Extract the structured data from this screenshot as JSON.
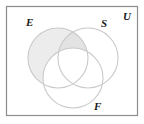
{
  "figure": {
    "kind": "venn-diagram",
    "title": "",
    "universe_border_color": "#8c8c8c",
    "circle_stroke_color": "#c9c9c9",
    "shade_light": "#ececec",
    "shade_dark": "#e3e3e3",
    "background": "#ffffff"
  },
  "universe": {
    "label": "U",
    "rect": {
      "x": 6,
      "y": 6,
      "width": 132,
      "height": 110
    }
  },
  "sets": [
    {
      "key": "E",
      "label": "E",
      "circle": {
        "cx": 58,
        "cy": 58,
        "r": 30
      },
      "label_pos": {
        "x": 26,
        "y": 17
      },
      "shaded": true
    },
    {
      "key": "S",
      "label": "S",
      "circle": {
        "cx": 88,
        "cy": 58,
        "r": 30
      },
      "label_pos": {
        "x": 101,
        "y": 18
      },
      "shaded": false
    },
    {
      "key": "F",
      "label": "F",
      "circle": {
        "cx": 73,
        "cy": 78,
        "r": 30
      },
      "label_pos": {
        "x": 94,
        "y": 101
      },
      "shaded": false
    }
  ],
  "shading": {
    "description": "E minus F is shaded; the portion of E that also lies in S (and outside F) is shaded a slightly darker gray.",
    "regions": [
      {
        "name": "E-only-minus-F",
        "tone": "light"
      },
      {
        "name": "E-and-S-minus-F",
        "tone": "dark"
      }
    ]
  },
  "chart_data": {
    "type": "venn",
    "sets": [
      "E",
      "S",
      "F"
    ],
    "title": "",
    "universe_label": "U",
    "shaded_expression": "E \\ F",
    "region_shading": {
      "E_only": true,
      "S_only": false,
      "F_only": false,
      "E_and_S_only": true,
      "E_and_F_only": false,
      "S_and_F_only": false,
      "E_and_S_and_F": false,
      "outside_all": false
    },
    "layout": {
      "E": {
        "cx": 58,
        "cy": 58,
        "r": 30
      },
      "S": {
        "cx": 88,
        "cy": 58,
        "r": 30
      },
      "F": {
        "cx": 73,
        "cy": 78,
        "r": 30
      },
      "universe_rect": {
        "x": 6,
        "y": 6,
        "w": 132,
        "h": 110
      }
    }
  }
}
